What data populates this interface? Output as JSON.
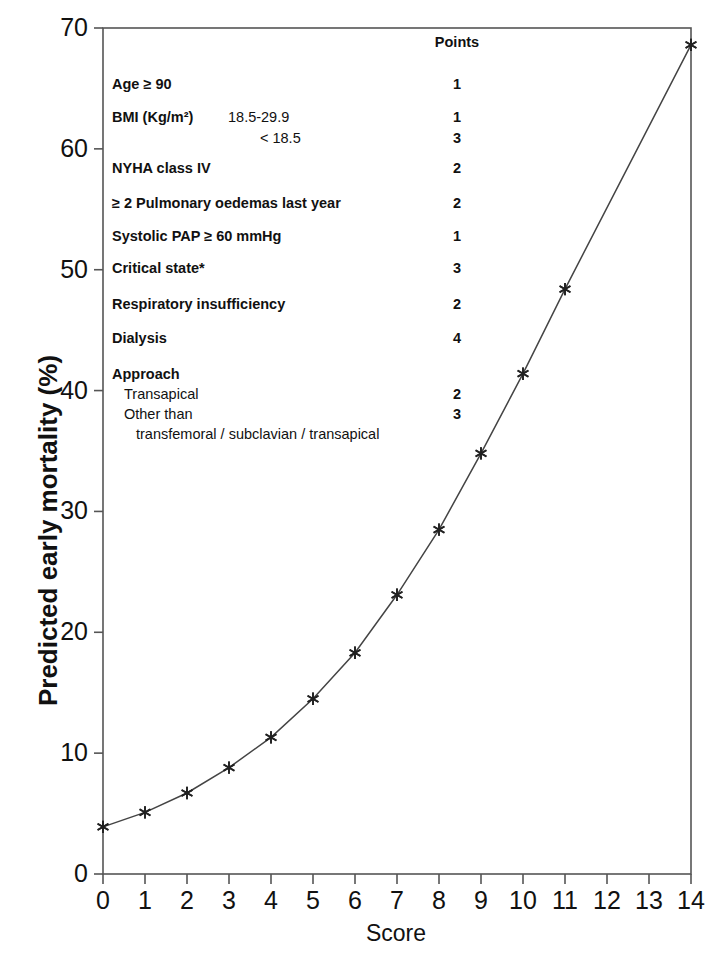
{
  "chart_data": {
    "type": "line",
    "title": "",
    "xlabel": "Score",
    "ylabel": "Predicted early mortality (%)",
    "xlim": [
      0,
      14
    ],
    "ylim": [
      0,
      70
    ],
    "grid": false,
    "legend_position": "none",
    "marker": "star",
    "x": [
      0,
      1,
      2,
      3,
      4,
      5,
      6,
      7,
      8,
      9,
      10,
      11,
      14
    ],
    "values": [
      3.9,
      5.1,
      6.7,
      8.8,
      11.3,
      14.5,
      18.3,
      23.1,
      28.5,
      34.8,
      41.4,
      48.4,
      68.6
    ],
    "series": [
      {
        "name": "Predicted early mortality",
        "x": [
          0,
          1,
          2,
          3,
          4,
          5,
          6,
          7,
          8,
          9,
          10,
          11,
          14
        ],
        "values": [
          3.9,
          5.1,
          6.7,
          8.8,
          11.3,
          14.5,
          18.3,
          23.1,
          28.5,
          34.8,
          41.4,
          48.4,
          68.6
        ]
      }
    ],
    "xticks": [
      "0",
      "1",
      "2",
      "3",
      "4",
      "5",
      "6",
      "7",
      "8",
      "9",
      "10",
      "11",
      "12",
      "13",
      "14"
    ],
    "yticks": [
      "0",
      "10",
      "20",
      "30",
      "40",
      "50",
      "60",
      "70"
    ],
    "line_color": "#444444",
    "marker_color": "#222222",
    "axis_color": "#555555"
  },
  "score_table": {
    "points_header": "Points",
    "rows": [
      {
        "label": "Age ≥ 90",
        "bold": true,
        "sub": "",
        "sub_x": 0,
        "points": "1",
        "y": 46
      },
      {
        "label": "BMI (Kg/m²)",
        "bold": true,
        "sub": "18.5-29.9",
        "sub_x": 116,
        "points": "1",
        "y": 79
      },
      {
        "label": "",
        "bold": false,
        "sub": "< 18.5",
        "sub_x": 148,
        "points": "3",
        "y": 100
      },
      {
        "label": "NYHA class IV",
        "bold": true,
        "sub": "",
        "sub_x": 0,
        "points": "2",
        "y": 130
      },
      {
        "label": "≥ 2 Pulmonary oedemas last year",
        "bold": true,
        "sub": "",
        "sub_x": 0,
        "points": "2",
        "y": 165
      },
      {
        "label": "Systolic PAP ≥ 60 mmHg",
        "bold": true,
        "sub": "",
        "sub_x": 0,
        "points": "1",
        "y": 198
      },
      {
        "label": "Critical state*",
        "bold": true,
        "sub": "",
        "sub_x": 0,
        "points": "3",
        "y": 230
      },
      {
        "label": "Respiratory insufficiency",
        "bold": true,
        "sub": "",
        "sub_x": 0,
        "points": "2",
        "y": 266
      },
      {
        "label": "Dialysis",
        "bold": true,
        "sub": "",
        "sub_x": 0,
        "points": "4",
        "y": 300
      },
      {
        "label": "Approach",
        "bold": true,
        "sub": "",
        "sub_x": 0,
        "points": "",
        "y": 336
      },
      {
        "label": "",
        "bold": false,
        "sub": "Transapical",
        "sub_x": 12,
        "points": "2",
        "y": 356
      },
      {
        "label": "",
        "bold": false,
        "sub": "Other than",
        "sub_x": 12,
        "points": "3",
        "y": 376
      },
      {
        "label": "",
        "bold": false,
        "sub": "transfemoral / subclavian / transapical",
        "sub_x": 24,
        "points": "",
        "y": 396
      }
    ]
  }
}
